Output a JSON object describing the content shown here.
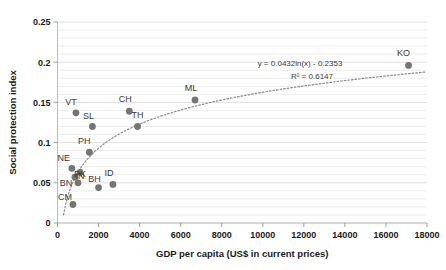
{
  "chart_data": {
    "type": "scatter",
    "title": "",
    "xlabel": "GDP per capita (US$ in current prices)",
    "ylabel": "Social protection index",
    "xlim": [
      0,
      18000
    ],
    "ylim": [
      0,
      0.25
    ],
    "xticks": [
      0,
      2000,
      4000,
      6000,
      8000,
      10000,
      12000,
      14000,
      16000,
      18000
    ],
    "xtick_labels": [
      "0",
      "2000",
      "4000",
      "6000",
      "8000",
      "10000",
      "12000",
      "14000",
      "16000",
      "18000"
    ],
    "yticks": [
      0,
      0.05,
      0.1,
      0.15,
      0.2,
      0.25
    ],
    "ytick_labels": [
      "0",
      "0.05",
      "0.1",
      "0.15",
      "0.2",
      "0.25"
    ],
    "grid": "horizontal-minor-0.01",
    "legend": "none",
    "marker_color": "#757575",
    "points": [
      {
        "label": "CM",
        "x": 750,
        "y": 0.023,
        "label_dx": -8,
        "label_dy": -5
      },
      {
        "label": "PK",
        "x": 1000,
        "y": 0.05,
        "label_dx": 2,
        "label_dy": -6
      },
      {
        "label": "BN",
        "x": 850,
        "y": 0.057,
        "label_dx": -9,
        "label_dy": 9
      },
      {
        "label": "IN",
        "x": 1100,
        "y": 0.063,
        "label_dx": 0,
        "label_dy": 7
      },
      {
        "label": "NE",
        "x": 700,
        "y": 0.068,
        "label_dx": -8,
        "label_dy": -7
      },
      {
        "label": "BH",
        "x": 2000,
        "y": 0.044,
        "label_dx": -4,
        "label_dy": -6
      },
      {
        "label": "ID",
        "x": 2700,
        "y": 0.048,
        "label_dx": -4,
        "label_dy": -8
      },
      {
        "label": "PH",
        "x": 1550,
        "y": 0.088,
        "label_dx": -5,
        "label_dy": -8
      },
      {
        "label": "SL",
        "x": 1700,
        "y": 0.12,
        "label_dx": -4,
        "label_dy": -8
      },
      {
        "label": "VT",
        "x": 900,
        "y": 0.137,
        "label_dx": -5,
        "label_dy": -8
      },
      {
        "label": "TH",
        "x": 3900,
        "y": 0.12,
        "label_dx": 0,
        "label_dy": -9
      },
      {
        "label": "CH",
        "x": 3500,
        "y": 0.139,
        "label_dx": -4,
        "label_dy": -9
      },
      {
        "label": "ML",
        "x": 6700,
        "y": 0.153,
        "label_dx": -4,
        "label_dy": -9
      },
      {
        "label": "KO",
        "x": 17100,
        "y": 0.196,
        "label_dx": -5,
        "label_dy": -9
      }
    ],
    "trendline": {
      "type": "logarithmic",
      "a": 0.0432,
      "b": -0.2353,
      "equation": "y = 0.0432ln(x) - 0.2353",
      "r_squared_text": "R² = 0.6147",
      "r_squared": 0.6147,
      "style": "dotted",
      "color": "#8a8a8a"
    }
  }
}
